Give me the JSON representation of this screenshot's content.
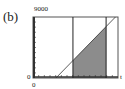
{
  "panel_label": "(b)",
  "chart_data": {
    "type": "area",
    "title": "",
    "xlabel": "",
    "ylabel": "",
    "xlim": [
      0,
      1
    ],
    "ylim": [
      0,
      9000
    ],
    "tick_labels": {
      "y_max": "9000",
      "y_min": "0",
      "x_min": "0",
      "x_max": "t"
    },
    "grid": false,
    "series": [
      {
        "name": "line",
        "kind": "line",
        "x": [
          0.27,
          0.97
        ],
        "y": [
          0,
          9000
        ]
      }
    ],
    "vertical_lines": [
      0.47,
      0.86
    ],
    "shaded_region": {
      "x_from": 0.47,
      "x_to": 0.86,
      "under": "line",
      "color": "#8c8c8c"
    }
  }
}
